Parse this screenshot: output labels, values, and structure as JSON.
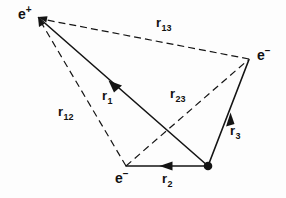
{
  "figure": {
    "background_color": "#fdfdfd",
    "stroke_color": "#111111",
    "width": 286,
    "height": 198,
    "caption": ""
  },
  "particles": [
    {
      "id": "positron",
      "symbol": "e",
      "charge": "+",
      "label": "e+",
      "x": 38,
      "y": 17,
      "label_x": 18,
      "label_y": 8,
      "marker": "none"
    },
    {
      "id": "electron-right",
      "symbol": "e",
      "charge": "−",
      "label": "e−",
      "x": 249,
      "y": 59,
      "label_x": 257,
      "label_y": 49,
      "marker": "none"
    },
    {
      "id": "electron-bottom",
      "symbol": "e",
      "charge": "−",
      "label": "e−",
      "x": 126,
      "y": 166,
      "label_x": 115,
      "label_y": 172,
      "marker": "none"
    },
    {
      "id": "nucleus",
      "symbol": "",
      "charge": "",
      "label": "",
      "x": 208,
      "y": 166,
      "label_x": 0,
      "label_y": 0,
      "marker": "filled-dot"
    }
  ],
  "vectors": [
    {
      "id": "r1",
      "name": "r",
      "subscript": "1",
      "style": "solid",
      "from": "nucleus",
      "to": "positron",
      "x1": 208,
      "y1": 166,
      "x2": 38,
      "y2": 17,
      "arrow": "mid",
      "arrow_x": 113,
      "arrow_y": 84,
      "label_x": 102,
      "label_y": 90
    },
    {
      "id": "r2",
      "name": "r",
      "subscript": "2",
      "style": "solid",
      "from": "nucleus",
      "to": "electron-bottom",
      "x1": 208,
      "y1": 166,
      "x2": 126,
      "y2": 166,
      "arrow": "mid",
      "arrow_x": 166,
      "arrow_y": 166,
      "label_x": 162,
      "label_y": 173
    },
    {
      "id": "r3",
      "name": "r",
      "subscript": "3",
      "style": "solid",
      "from": "nucleus",
      "to": "electron-right",
      "x1": 208,
      "y1": 166,
      "x2": 249,
      "y2": 59,
      "arrow": "mid",
      "arrow_x": 229,
      "arrow_y": 117,
      "label_x": 230,
      "label_y": 125
    },
    {
      "id": "r12",
      "name": "r",
      "subscript": "12",
      "style": "dashed",
      "from": "electron-bottom",
      "to": "positron",
      "x1": 126,
      "y1": 166,
      "x2": 38,
      "y2": 17,
      "arrow": "end",
      "arrow_x": 0,
      "arrow_y": 0,
      "label_x": 58,
      "label_y": 106
    },
    {
      "id": "r13",
      "name": "r",
      "subscript": "13",
      "style": "dashed",
      "from": "electron-right",
      "to": "positron",
      "x1": 249,
      "y1": 59,
      "x2": 38,
      "y2": 17,
      "arrow": "end",
      "arrow_x": 0,
      "arrow_y": 0,
      "label_x": 156,
      "label_y": 17
    },
    {
      "id": "r23",
      "name": "r",
      "subscript": "23",
      "style": "dashed",
      "from": "electron-bottom",
      "to": "electron-right",
      "x1": 126,
      "y1": 166,
      "x2": 249,
      "y2": 59,
      "arrow": "none",
      "arrow_x": 0,
      "arrow_y": 0,
      "label_x": 170,
      "label_y": 88
    }
  ]
}
